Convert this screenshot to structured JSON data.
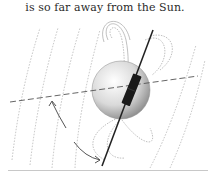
{
  "caption": {
    "text": "is so far away from the Sun."
  },
  "figure": {
    "elements": [
      "sphere-planet",
      "bar-magnet",
      "rotation-axis",
      "equator-dashed-line",
      "magnetic-field-lines",
      "tilt-arrows"
    ],
    "colors": {
      "sphere_light": "#f4f4f4",
      "sphere_dark": "#8a8a8a",
      "magnet": "#1a1a1a",
      "axis": "#2a2a2a",
      "field_lines": "#9a9a9a",
      "arrows": "#555555",
      "rule": "#c8c8c8"
    }
  }
}
